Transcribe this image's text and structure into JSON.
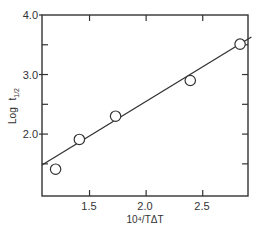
{
  "chart_data": {
    "type": "scatter",
    "title": "",
    "xlabel": "10⁴/TΔT",
    "ylabel": "Log t₁/₂",
    "xlim": [
      1.08,
      2.9
    ],
    "ylim": [
      0.96,
      4.0
    ],
    "x_ticks": [
      1.5,
      2.0,
      2.5
    ],
    "x_tick_labels": [
      "1.5",
      "2.0",
      "2.5"
    ],
    "y_ticks": [
      2.0,
      3.0,
      4.0
    ],
    "y_tick_labels": [
      "2.0",
      "3.0",
      "4.0"
    ],
    "y_minor_ticks": [
      1.5,
      2.5,
      3.5
    ],
    "grid": false,
    "legend": null,
    "series": [
      {
        "name": "data",
        "marker": "open-circle",
        "x": [
          1.2,
          1.41,
          1.73,
          2.39,
          2.83
        ],
        "y": [
          1.41,
          1.91,
          2.3,
          2.9,
          3.51
        ]
      },
      {
        "name": "fit",
        "style": "line",
        "x": [
          1.08,
          2.93
        ],
        "y": [
          1.48,
          3.63
        ]
      }
    ]
  },
  "labels": {
    "xlabel": "10⁴/TΔT",
    "ylabel_main": "Log",
    "ylabel_sub": "t",
    "ylabel_subscript": "1/2",
    "x1": "1.5",
    "x2": "2.0",
    "x3": "2.5",
    "y1": "2.0",
    "y2": "3.0",
    "y3": "4.0"
  }
}
